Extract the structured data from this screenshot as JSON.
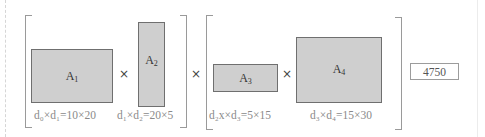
{
  "diagram": {
    "groups": [
      {
        "matrices": [
          {
            "name": "A",
            "index": "1",
            "dims_label": "d₀×d₁=10×20",
            "rows": 10,
            "cols": 20
          },
          {
            "name": "A",
            "index": "2",
            "dims_label": "d₁×d₂=20×5",
            "rows": 20,
            "cols": 5
          }
        ]
      },
      {
        "matrices": [
          {
            "name": "A",
            "index": "3",
            "dims_label": "d₂x×d₃=5×15",
            "rows": 5,
            "cols": 15
          },
          {
            "name": "A",
            "index": "4",
            "dims_label": "d₃×d₄=15×30",
            "rows": 15,
            "cols": 30
          }
        ]
      }
    ],
    "operator": "×",
    "result": "4750",
    "colors": {
      "matrix_fill": "#cfcfcf",
      "matrix_border": "#6f6f6f",
      "bracket": "#9a9a9a",
      "label_text": "#8a8a8a"
    }
  }
}
